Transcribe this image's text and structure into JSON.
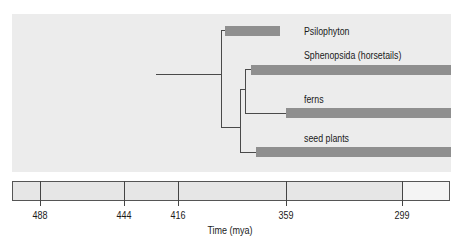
{
  "diagram": {
    "title": "",
    "taxa": [
      {
        "label": "Psilophyton",
        "bar_start_x": 225,
        "bar_end_x": 280
      },
      {
        "label": "Sphenopsida (horsetails)",
        "bar_start_x": 251,
        "bar_end_x": 451
      },
      {
        "label": "ferns",
        "bar_start_x": 286,
        "bar_end_x": 451
      },
      {
        "label": "seed plants",
        "bar_start_x": 256,
        "bar_end_x": 451
      }
    ],
    "timeline": {
      "ticks": [
        "488",
        "444",
        "416",
        "359",
        "299"
      ],
      "axis_title": "Time (mya)"
    },
    "colors": {
      "panel_bg": "#ececec",
      "bar": "#8f8f8f",
      "line": "#4a4a4a",
      "timeline_bg": "#e6e6e6",
      "timeline_recent": "#f4f4f4"
    }
  }
}
